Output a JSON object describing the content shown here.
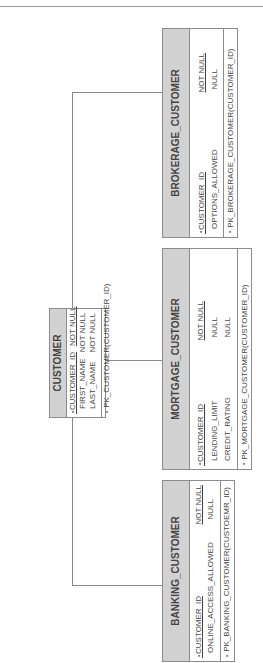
{
  "page_header": {
    "fragment_left": "— · —",
    "fragment_right": "— — · —"
  },
  "diagram": {
    "orientation": "rotated 90 degrees counter-clockwise",
    "colors": {
      "header_fill": "#d2d2d2",
      "border": "#8c8c8c",
      "connector": "#8a8a8a"
    },
    "entities": {
      "customer": {
        "name": "CUSTOMER",
        "columns": [
          {
            "icon": "key-icon",
            "name": "CUSTOMER_ID",
            "nullability": "NOT NULL",
            "primary_key": true
          },
          {
            "name": "FIRST_NAME",
            "nullability": "NOT NULL"
          },
          {
            "name": "LAST_NAME",
            "nullability": "NOT NULL"
          }
        ],
        "constraint": "PK_CUSTOMER(CUSTOMER_ID)"
      },
      "brokerage_customer": {
        "name": "BROKERAGE_CUSTOMER",
        "columns": [
          {
            "icon": "key-icon",
            "name": "CUSTOMER_ID",
            "nullability": "NOT NULL",
            "primary_key": true
          },
          {
            "name": "OPTIONS_ALLOWED",
            "nullability": "NULL"
          }
        ],
        "constraint": "PK_BROKERAGE_CUSTOMER(CUSTOMER_ID)"
      },
      "mortgage_customer": {
        "name": "MORTGAGE_CUSTOMER",
        "columns": [
          {
            "icon": "key-icon",
            "name": "CUSTOMER_ID",
            "nullability": "NOT NULL",
            "primary_key": true
          },
          {
            "name": "LENDING_LIMIT",
            "nullability": "NULL"
          },
          {
            "name": "CREDIT_RATING",
            "nullability": "NULL"
          }
        ],
        "constraint": "PK_MORTGAGE_CUSTOMER(CUSTOMER_ID)"
      },
      "banking_customer": {
        "name": "BANKING_CUSTOMER",
        "columns": [
          {
            "icon": "key-icon",
            "name": "CUSTOMER_ID",
            "nullability": "NOT NULL",
            "primary_key": true
          },
          {
            "name": "ONLINE_ACCESS_ALLOWED",
            "nullability": "NULL"
          }
        ],
        "constraint": "PK_BANKING_CUSTOMER(CUSTOEMR_ID)"
      }
    },
    "relationships": [
      {
        "from": "CUSTOMER",
        "to": "BROKERAGE_CUSTOMER"
      },
      {
        "from": "CUSTOMER",
        "to": "MORTGAGE_CUSTOMER"
      },
      {
        "from": "CUSTOMER",
        "to": "BANKING_CUSTOMER"
      }
    ]
  }
}
